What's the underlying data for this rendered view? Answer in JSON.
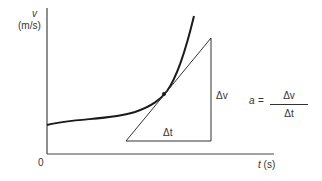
{
  "diagram": {
    "y_axis": {
      "symbol": "v",
      "unit": "(m/s)"
    },
    "x_axis": {
      "symbol": "t",
      "unit": "(s)",
      "label": "t (s)"
    },
    "origin_label": "0",
    "triangle": {
      "horizontal_label": "Δt",
      "vertical_label": "Δv"
    },
    "equation": {
      "lhs": "a",
      "equals": "=",
      "numerator": "Δv",
      "denominator": "Δt"
    },
    "colors": {
      "line": "#1a1a1a",
      "axis": "#444444",
      "text": "#333333"
    }
  }
}
